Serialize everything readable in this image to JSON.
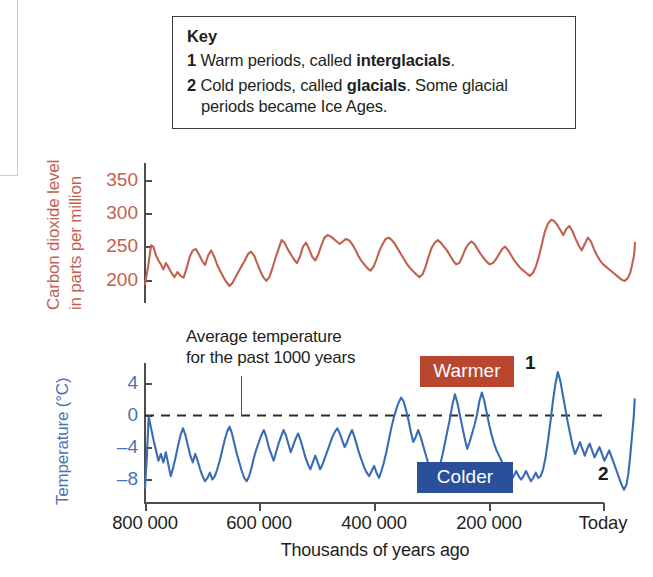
{
  "key": {
    "title": "Key",
    "items": [
      {
        "num": "1",
        "pre": "Warm periods, called ",
        "bold": "interglacials",
        "post": "."
      },
      {
        "num": "2",
        "pre": "Cold periods, called ",
        "bold": "glacials",
        "post": ". Some glacial"
      }
    ],
    "continuation": "periods became Ice Ages."
  },
  "annotation": {
    "line1": "Average temperature",
    "line2": "for the past 1000 years"
  },
  "badges": {
    "warmer": "Warmer",
    "colder": "Colder"
  },
  "markers": {
    "one": "1",
    "two": "2"
  },
  "colors": {
    "co2": "#c2604f",
    "temperature": "#3a6cb5",
    "warmer_badge": "#b9462f",
    "colder_badge": "#2a4f9b",
    "axis": "#4d4d4d",
    "text": "#231f20"
  },
  "chart_data": [
    {
      "type": "line",
      "id": "co2",
      "title": "",
      "ylabel_line1": "Carbon dioxide level",
      "ylabel_line2": "in parts per million",
      "xlabel": "Thousands of years ago",
      "ylim": [
        160,
        380
      ],
      "yticks": [
        200,
        250,
        300,
        350
      ],
      "ytick_labels": [
        "200",
        "250",
        "300",
        "350"
      ],
      "xlim": [
        800000,
        0
      ],
      "xticks": [
        800000,
        600000,
        400000,
        200000,
        0
      ],
      "xtick_labels": [
        "800 000",
        "600 000",
        "400 000",
        "200 000",
        "Today"
      ],
      "grid": false,
      "legend": "none",
      "series": [
        {
          "name": "Atmospheric CO2 (ppm)",
          "color": "#c2604f",
          "x": [
            800000,
            795000,
            790000,
            786000,
            782000,
            778000,
            774000,
            770000,
            766000,
            762000,
            757000,
            752000,
            747000,
            742000,
            737000,
            732000,
            727000,
            722000,
            717000,
            712000,
            707000,
            702000,
            697000,
            692000,
            687000,
            682000,
            677000,
            672000,
            667000,
            662000,
            657000,
            652000,
            647000,
            642000,
            637000,
            632000,
            627000,
            622000,
            617000,
            612000,
            607000,
            602000,
            597000,
            592000,
            587000,
            582000,
            577000,
            572000,
            567000,
            562000,
            557000,
            552000,
            547000,
            542000,
            537000,
            532000,
            527000,
            522000,
            517000,
            512000,
            507000,
            502000,
            497000,
            492000,
            487000,
            482000,
            477000,
            472000,
            467000,
            462000,
            457000,
            452000,
            447000,
            442000,
            437000,
            432000,
            427000,
            422000,
            417000,
            412000,
            407000,
            402000,
            397000,
            392000,
            387000,
            382000,
            377000,
            372000,
            367000,
            362000,
            357000,
            352000,
            347000,
            342000,
            337000,
            332000,
            327000,
            322000,
            317000,
            312000,
            307000,
            302000,
            297000,
            292000,
            287000,
            282000,
            277000,
            272000,
            267000,
            262000,
            257000,
            252000,
            247000,
            242000,
            237000,
            232000,
            227000,
            222000,
            217000,
            212000,
            207000,
            202000,
            197000,
            192000,
            187000,
            182000,
            177000,
            172000,
            167000,
            162000,
            157000,
            152000,
            147000,
            142000,
            137000,
            132000,
            127000,
            122000,
            117000,
            112000,
            107000,
            102000,
            97000,
            92000,
            87000,
            82000,
            77000,
            72000,
            67000,
            62000,
            57000,
            52000,
            47000,
            42000,
            37000,
            32000,
            27000,
            22000,
            17000,
            12000,
            8000,
            5000,
            2000,
            500,
            100
          ],
          "y": [
            185,
            212,
            246,
            243,
            230,
            222,
            216,
            208,
            218,
            212,
            203,
            196,
            204,
            198,
            195,
            210,
            228,
            238,
            240,
            232,
            222,
            215,
            230,
            238,
            228,
            215,
            205,
            196,
            188,
            182,
            187,
            196,
            205,
            214,
            222,
            232,
            236,
            230,
            218,
            206,
            196,
            190,
            196,
            210,
            226,
            240,
            254,
            250,
            240,
            232,
            224,
            218,
            228,
            244,
            250,
            240,
            228,
            222,
            232,
            246,
            258,
            262,
            260,
            256,
            252,
            248,
            252,
            256,
            254,
            248,
            240,
            230,
            222,
            216,
            210,
            206,
            212,
            224,
            238,
            248,
            256,
            258,
            254,
            248,
            240,
            232,
            224,
            216,
            210,
            205,
            200,
            196,
            200,
            212,
            228,
            242,
            250,
            254,
            250,
            244,
            238,
            230,
            222,
            216,
            218,
            228,
            240,
            248,
            252,
            248,
            240,
            232,
            226,
            220,
            216,
            218,
            224,
            232,
            240,
            244,
            238,
            230,
            222,
            216,
            210,
            206,
            202,
            198,
            202,
            212,
            228,
            248,
            268,
            280,
            286,
            284,
            278,
            270,
            262,
            272,
            276,
            268,
            256,
            246,
            238,
            248,
            258,
            252,
            240,
            230,
            222,
            216,
            212,
            208,
            204,
            200,
            196,
            192,
            190,
            194,
            202,
            214,
            228,
            240,
            250,
            262,
            270,
            276,
            280,
            284,
            368
          ]
        }
      ]
    },
    {
      "type": "line",
      "id": "temperature",
      "title": "",
      "ylabel": "Temperature (°C)",
      "xlabel": "Thousands of years ago",
      "ylim": [
        -11,
        6
      ],
      "yticks": [
        4,
        0,
        -4,
        -8
      ],
      "ytick_labels": [
        "4",
        "0",
        "–4",
        "–8"
      ],
      "xlim": [
        800000,
        0
      ],
      "xticks": [
        800000,
        600000,
        400000,
        200000,
        0
      ],
      "xtick_labels": [
        "800 000",
        "600 000",
        "400 000",
        "200 000",
        "Today"
      ],
      "grid": false,
      "legend": "none",
      "reference_line": {
        "value": 0,
        "style": "dashed",
        "label": "Average temperature for the past 1000 years"
      },
      "series": [
        {
          "name": "Temperature anomaly (°C)",
          "color": "#3a6cb5",
          "x": [
            800000,
            797000,
            794000,
            790000,
            786000,
            782000,
            778000,
            774000,
            770000,
            766000,
            762000,
            758000,
            754000,
            750000,
            746000,
            742000,
            738000,
            734000,
            730000,
            726000,
            722000,
            718000,
            714000,
            710000,
            706000,
            702000,
            698000,
            694000,
            690000,
            686000,
            682000,
            678000,
            674000,
            670000,
            666000,
            662000,
            658000,
            654000,
            650000,
            646000,
            642000,
            638000,
            634000,
            630000,
            626000,
            622000,
            618000,
            614000,
            610000,
            606000,
            602000,
            598000,
            594000,
            590000,
            586000,
            582000,
            578000,
            574000,
            570000,
            566000,
            562000,
            558000,
            554000,
            550000,
            546000,
            542000,
            538000,
            534000,
            530000,
            526000,
            522000,
            518000,
            514000,
            510000,
            506000,
            502000,
            498000,
            494000,
            490000,
            486000,
            482000,
            478000,
            474000,
            470000,
            466000,
            462000,
            458000,
            454000,
            450000,
            446000,
            442000,
            438000,
            434000,
            430000,
            426000,
            422000,
            418000,
            414000,
            410000,
            406000,
            402000,
            398000,
            394000,
            390000,
            386000,
            382000,
            378000,
            374000,
            370000,
            366000,
            362000,
            358000,
            354000,
            350000,
            346000,
            342000,
            338000,
            334000,
            330000,
            326000,
            322000,
            318000,
            314000,
            310000,
            306000,
            302000,
            298000,
            294000,
            290000,
            286000,
            282000,
            278000,
            274000,
            270000,
            266000,
            262000,
            258000,
            254000,
            250000,
            246000,
            242000,
            238000,
            234000,
            230000,
            226000,
            222000,
            218000,
            214000,
            210000,
            206000,
            202000,
            198000,
            194000,
            190000,
            186000,
            182000,
            178000,
            174000,
            170000,
            166000,
            162000,
            158000,
            154000,
            150000,
            146000,
            142000,
            138000,
            134000,
            130000,
            126000,
            122000,
            118000,
            114000,
            110000,
            106000,
            102000,
            98000,
            94000,
            90000,
            86000,
            82000,
            78000,
            74000,
            70000,
            66000,
            62000,
            58000,
            54000,
            50000,
            46000,
            42000,
            38000,
            34000,
            30000,
            26000,
            22000,
            18000,
            14000,
            11000,
            8000,
            5000,
            2000,
            500
          ],
          "y": [
            -9.6,
            -6.0,
            -1.2,
            -2.6,
            -4.0,
            -5.2,
            -6.4,
            -5.6,
            -6.6,
            -5.4,
            -6.8,
            -8.2,
            -7.2,
            -6.0,
            -4.6,
            -3.4,
            -2.6,
            -3.4,
            -4.6,
            -5.8,
            -6.6,
            -5.6,
            -6.4,
            -7.4,
            -8.2,
            -8.8,
            -8.4,
            -7.8,
            -8.6,
            -8.2,
            -7.4,
            -6.4,
            -5.2,
            -4.0,
            -3.0,
            -2.4,
            -3.2,
            -4.4,
            -5.6,
            -6.6,
            -7.6,
            -8.4,
            -8.8,
            -8.2,
            -7.2,
            -6.0,
            -5.0,
            -4.2,
            -3.4,
            -2.8,
            -3.6,
            -4.8,
            -5.6,
            -6.4,
            -5.4,
            -4.4,
            -3.6,
            -2.8,
            -3.4,
            -4.4,
            -5.4,
            -4.6,
            -3.8,
            -3.2,
            -4.0,
            -5.0,
            -6.0,
            -6.8,
            -7.4,
            -6.6,
            -5.8,
            -6.6,
            -7.4,
            -6.8,
            -6.0,
            -5.2,
            -4.4,
            -3.6,
            -3.0,
            -2.6,
            -3.2,
            -4.0,
            -4.8,
            -4.2,
            -3.4,
            -2.8,
            -3.6,
            -4.6,
            -5.6,
            -6.4,
            -7.2,
            -7.8,
            -8.2,
            -7.6,
            -7.0,
            -7.8,
            -8.4,
            -7.6,
            -6.6,
            -5.4,
            -4.0,
            -2.6,
            -1.4,
            -0.4,
            0.4,
            1.0,
            0.6,
            -0.4,
            -1.6,
            -3.0,
            -4.2,
            -3.6,
            -2.8,
            -3.6,
            -4.6,
            -5.6,
            -6.6,
            -7.4,
            -8.0,
            -8.6,
            -7.8,
            -6.8,
            -5.6,
            -4.2,
            -2.8,
            -1.4,
            0.2,
            1.4,
            0.4,
            -1.0,
            -2.4,
            -3.8,
            -5.0,
            -4.2,
            -3.2,
            -2.2,
            -1.0,
            0.6,
            1.6,
            0.6,
            -0.8,
            -2.2,
            -3.4,
            -4.4,
            -5.2,
            -5.8,
            -6.4,
            -7.0,
            -7.6,
            -8.2,
            -8.6,
            -8.2,
            -7.6,
            -8.2,
            -8.6,
            -8.2,
            -7.6,
            -8.2,
            -8.8,
            -8.4,
            -7.8,
            -8.4,
            -8.2,
            -7.4,
            -6.0,
            -4.0,
            -1.8,
            0.6,
            2.6,
            4.0,
            3.0,
            1.4,
            -0.2,
            -1.8,
            -3.2,
            -4.6,
            -5.6,
            -5.0,
            -4.2,
            -5.0,
            -5.8,
            -5.0,
            -4.4,
            -5.2,
            -6.0,
            -5.4,
            -4.8,
            -5.6,
            -6.4,
            -5.8,
            -5.2,
            -6.0,
            -6.8,
            -7.6,
            -8.4,
            -9.2,
            -9.8,
            -9.2,
            -8.0,
            -6.0,
            -3.6,
            -1.2,
            0.8,
            0.0,
            -0.6,
            1.2,
            3.0,
            5.4
          ]
        }
      ]
    }
  ]
}
